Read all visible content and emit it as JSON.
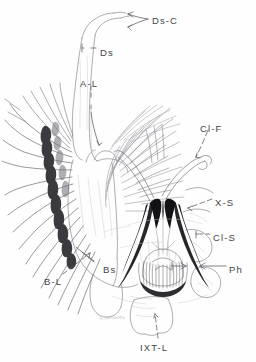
{
  "figure": {
    "kind": "scientific-line-drawing",
    "background_color": "#fefefe",
    "ink_color": "#5a5a5e",
    "dark_ink_color": "#1d1d1f",
    "light_ink_color": "#a9a9ae",
    "label_color": "#444447",
    "signature_color": "#b9b9bd"
  },
  "labels": [
    {
      "id": "ds-c",
      "text": "Ds-C",
      "x": 152,
      "y": 16,
      "leader": true
    },
    {
      "id": "ds",
      "text": "Ds",
      "x": 100,
      "y": 48,
      "leader": true
    },
    {
      "id": "a-l",
      "text": "A-L",
      "x": 80,
      "y": 79,
      "leader": true
    },
    {
      "id": "cl-f",
      "text": "Cl-F",
      "x": 200,
      "y": 124,
      "leader": true
    },
    {
      "id": "x-s",
      "text": "X-S",
      "x": 215,
      "y": 198,
      "leader": true
    },
    {
      "id": "cl-s",
      "text": "Cl-S",
      "x": 213,
      "y": 233,
      "leader": true
    },
    {
      "id": "ph",
      "text": "Ph",
      "x": 229,
      "y": 265,
      "leader": true
    },
    {
      "id": "b-l",
      "text": "B-L",
      "x": 44,
      "y": 277,
      "leader": true
    },
    {
      "id": "bs",
      "text": "Bs",
      "x": 103,
      "y": 265,
      "leader": false
    },
    {
      "id": "ixt-l",
      "text": "IXT-L",
      "x": 140,
      "y": 343,
      "leader": true
    }
  ],
  "signature": {
    "text": "A.Shimabu",
    "x": 99,
    "y": 315
  }
}
